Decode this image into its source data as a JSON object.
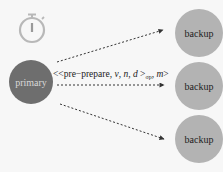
{
  "diagram": {
    "type": "pbft-pre-prepare",
    "nodes": {
      "primary": {
        "label": "primary",
        "fill": "#6e6e6e",
        "text_color": "#d8d8d8",
        "cx": 31,
        "cy": 82,
        "r": 22
      },
      "backups": [
        {
          "label": "backup",
          "fill": "#b3b3b3",
          "cx": 199,
          "cy": 33,
          "r": 24
        },
        {
          "label": "backup",
          "fill": "#b3b3b3",
          "cx": 199,
          "cy": 86,
          "r": 24
        },
        {
          "label": "backup",
          "fill": "#b3b3b3",
          "cx": 199,
          "cy": 139,
          "r": 24
        }
      ]
    },
    "timer_icon": {
      "name": "stopwatch",
      "color": "#b8b8b8"
    },
    "message": {
      "prefix": "<<pre−prepare, ",
      "v": "v",
      "sep1": ", ",
      "n": "n",
      "sep2": ", ",
      "d": "d",
      "close": " >",
      "subscript": "σp",
      "sep3": ", ",
      "m": "m",
      "suffix": ">"
    },
    "arrows": [
      {
        "from": [
          57,
          62
        ],
        "to": [
          163,
          30
        ],
        "style": "dashed"
      },
      {
        "from": [
          57,
          85
        ],
        "to": [
          164,
          85
        ],
        "style": "dashed"
      },
      {
        "from": [
          60,
          104
        ],
        "to": [
          164,
          139
        ],
        "style": "dashed"
      }
    ],
    "arrow_color": "#333333"
  }
}
